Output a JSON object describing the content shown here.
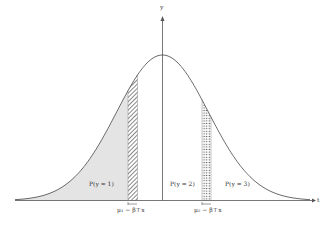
{
  "figure": {
    "type": "ordered-probit-latent-density",
    "axes": {
      "x_label": "t",
      "y_label": "y"
    },
    "regions": [
      {
        "label": "P(y = 1)",
        "fill": "light-gray"
      },
      {
        "label": "P(y = 2)",
        "fill": "none"
      },
      {
        "label": "P(y = 3)",
        "fill": "none"
      }
    ],
    "thresholds": [
      {
        "label": "μ₁ − β⊤x",
        "pattern": "hatched"
      },
      {
        "label": "μ₂ − β⊤x",
        "pattern": "dotted"
      }
    ]
  },
  "colors": {
    "curve": "#444444",
    "axis": "#555555",
    "shade": "#e4e4e4",
    "hatch": "#555555",
    "dots": "#555555"
  }
}
